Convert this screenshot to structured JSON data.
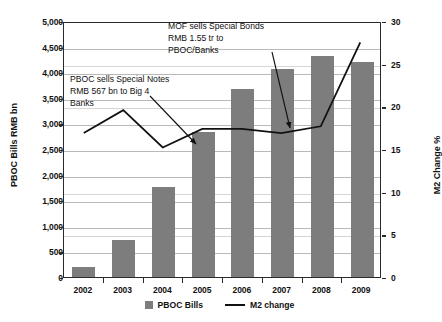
{
  "chart_data": {
    "type": "bar",
    "title": "",
    "subtitle": "",
    "xlabel": "",
    "ylabel": "PBOC Bills RMB bn",
    "y2label": "M2 Change %",
    "categories": [
      "2002",
      "2003",
      "2004",
      "2005",
      "2006",
      "2007",
      "2008",
      "2009"
    ],
    "ylim": [
      0,
      5000
    ],
    "y2lim": [
      0,
      30
    ],
    "yticks": [
      "0",
      "500",
      "1,000",
      "1,500",
      "2,000",
      "2,500",
      "3,000",
      "3,500",
      "4,000",
      "4,500",
      "5,000"
    ],
    "ytick_values": [
      0,
      500,
      1000,
      1500,
      2000,
      2500,
      3000,
      3500,
      4000,
      4500,
      5000
    ],
    "y2ticks": [
      "0",
      "5",
      "10",
      "15",
      "20",
      "25",
      "30"
    ],
    "y2tick_values": [
      0,
      5,
      10,
      15,
      20,
      25,
      30
    ],
    "grid": true,
    "legend_position": "bottom",
    "series": [
      {
        "name": "PBOC Bills",
        "type": "bar",
        "axis": "left",
        "color": "#7d7d7d",
        "values": [
          200,
          720,
          1750,
          2830,
          3680,
          4060,
          4320,
          4200
        ]
      },
      {
        "name": "M2 change",
        "type": "line",
        "axis": "right",
        "color": "#111111",
        "values": [
          17.0,
          19.7,
          15.3,
          17.5,
          17.5,
          17.0,
          17.8,
          27.7
        ]
      }
    ],
    "annotations": [
      {
        "id": "pboc-special-notes",
        "lines": [
          "PBOC sells Special Notes",
          "RMB 567 bn to Big 4",
          "Banks"
        ],
        "points_to": "2004"
      },
      {
        "id": "mof-special-bonds",
        "lines": [
          "MOF sells Special Bonds",
          "RMB 1.55 tr to",
          "PBOC/Banks"
        ],
        "points_to": "2007"
      }
    ]
  },
  "legend": {
    "items": [
      {
        "label": "PBOC Bills",
        "marker": "bar-swatch-icon"
      },
      {
        "label": "M2 change",
        "marker": "line-swatch-icon"
      }
    ]
  }
}
